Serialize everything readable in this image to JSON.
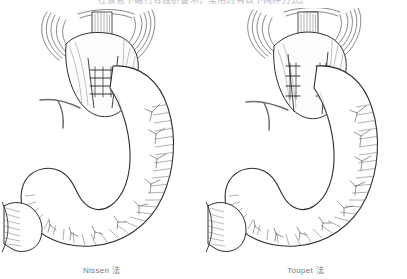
{
  "page": {
    "header_text": "在食管下端行胃底折叠术，常用的有以下两种方式。",
    "background_color": "#ffffff",
    "ink_color": "#2e2e33",
    "hatch_color": "#6f7075",
    "caption_color": "#77787c"
  },
  "figures": [
    {
      "id": "nissen",
      "caption": "Nissen 法",
      "technique_label": "Nissen",
      "suffix_label": "法",
      "wrap_type": "complete-360-degree-wrap",
      "suture_rows": 1,
      "suture_count": 4,
      "anatomy": [
        "esophagus",
        "diaphragmatic-hiatus",
        "gastric-fundus-wrap",
        "gastric-body",
        "greater-curvature",
        "lesser-curvature",
        "antrum",
        "pylorus",
        "duodenal-bulb",
        "vagus-nerve-branch",
        "gastric-vessels"
      ]
    },
    {
      "id": "toupet",
      "caption": "Toupet 法",
      "technique_label": "Toupet",
      "suffix_label": "法",
      "wrap_type": "partial-270-degree-posterior-wrap",
      "suture_rows": 2,
      "suture_count": 8,
      "anatomy": [
        "esophagus",
        "diaphragmatic-hiatus",
        "gastric-fundus-partial-wrap",
        "gastric-body",
        "greater-curvature",
        "lesser-curvature",
        "antrum",
        "pylorus",
        "duodenal-bulb",
        "vagus-nerve-branch",
        "gastric-vessels"
      ]
    }
  ]
}
